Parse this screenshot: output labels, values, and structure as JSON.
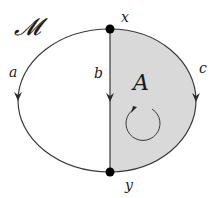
{
  "diagram": {
    "title_label": "𝓜",
    "colors": {
      "background": "#ffffff",
      "stroke": "#3a3a3a",
      "shaded_region": "#d9d9d9",
      "vertex": "#000000"
    },
    "vertices": [
      {
        "id": "x",
        "label": "x"
      },
      {
        "id": "y",
        "label": "y"
      }
    ],
    "edges": [
      {
        "id": "a",
        "label": "a",
        "from": "x",
        "to": "y",
        "side": "left",
        "direction": "down"
      },
      {
        "id": "b",
        "label": "b",
        "from": "x",
        "to": "y",
        "side": "middle",
        "direction": "down"
      },
      {
        "id": "c",
        "label": "c",
        "from": "x",
        "to": "y",
        "side": "right",
        "direction": "down"
      }
    ],
    "regions": [
      {
        "id": "A",
        "label": "A",
        "shaded": true,
        "bounded_by": [
          "b",
          "c"
        ],
        "orientation": "clockwise"
      }
    ]
  }
}
